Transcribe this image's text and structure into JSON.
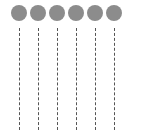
{
  "diagram": {
    "type": "lifelines",
    "node_color": "#8c8c8c",
    "label_color": "#9a9a9a",
    "line_color": "#555555",
    "nodes": [
      {
        "label": "",
        "x": 11
      },
      {
        "label": "",
        "x": 30
      },
      {
        "label": "",
        "x": 49
      },
      {
        "label": "",
        "x": 68
      },
      {
        "label": "",
        "x": 87
      },
      {
        "label": "",
        "x": 106
      }
    ]
  }
}
